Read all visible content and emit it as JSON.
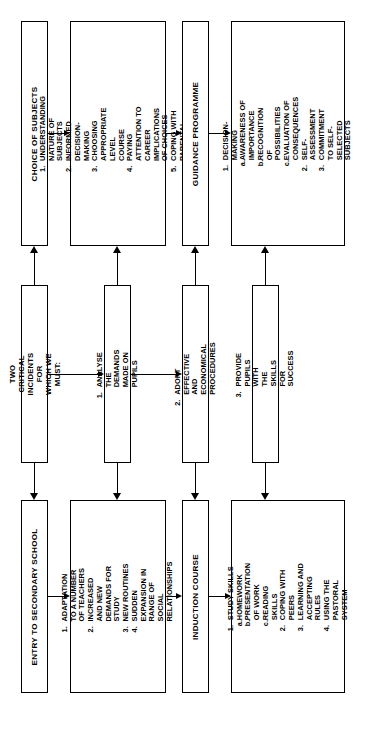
{
  "diagram": {
    "orientation": "text rotated 90 degrees counter-clockwise",
    "columns": [
      {
        "id": "col1",
        "top": {
          "label": "CHOICE OF SUBJECTS"
        },
        "middle": {
          "label": "TWO CRITICAL INCIDENTS\nFOR WHICH WE MUST:"
        },
        "bottom": {
          "label": "ENTRY TO SECONDARY SCHOOL"
        }
      },
      {
        "id": "col2",
        "top": {
          "items": [
            {
              "marker": "1.",
              "text": "UNDERSTANDING NATURE OF\nSUBJECTS"
            },
            {
              "marker": "2.",
              "text": "INFORMED DECISION-MAKING"
            },
            {
              "marker": "3.",
              "text": "CHOOSING APPROPRIATE LEVEL\nCOURSE"
            },
            {
              "marker": "4.",
              "text": "PAYING ATTENTION TO CAREER\nIMPLICATIONS OF CHOICES"
            },
            {
              "marker": "5.",
              "text": "COPING WITH PARENTAL INFLUENCE"
            }
          ]
        },
        "middle": {
          "marker": "1.",
          "label": "ANALYSE THE DEMANDS\nMADE ON PUPILS"
        },
        "bottom": {
          "items": [
            {
              "marker": "1.",
              "text": "ADAPTATION TO A NUMBER\nOF TEACHERS"
            },
            {
              "marker": "2.",
              "text": "INCREASED AND NEW\nDEMANDS FOR STUDY"
            },
            {
              "marker": "3.",
              "text": "NEW ROUTINES"
            },
            {
              "marker": "4.",
              "text": "SUDDEN EXPANSION IN\nRANGE OF SOCIAL\nRELATIONSHIPS"
            }
          ]
        }
      },
      {
        "id": "col3",
        "top": {
          "label": "GUIDANCE PROGRAMME"
        },
        "middle": {
          "marker": "2.",
          "label": "ADOPT EFFECTIVE AND\nECONOMICAL PROCEDURES"
        },
        "bottom": {
          "label": "INDUCTION COURSE"
        }
      },
      {
        "id": "col4",
        "top": {
          "items": [
            {
              "marker": "1.",
              "text": "DECISION-MAKING"
            },
            {
              "marker": "a.",
              "sub": true,
              "text": "AWARENESS OF IMPORTANCE"
            },
            {
              "marker": "b.",
              "sub": true,
              "text": "RECOGNITION OF POSSIBILITIES"
            },
            {
              "marker": "c.",
              "sub": true,
              "text": "EVALUATION OF CONSEQUENCES"
            },
            {
              "marker": "2.",
              "text": "SELF-ASSESSMENT"
            },
            {
              "marker": "3.",
              "text": "COMMITMENT TO SELF-SELECTED\nSUBJECTS"
            }
          ]
        },
        "middle": {
          "marker": "3.",
          "label": "PROVIDE PUPILS WITH\nTHE SKILLS FOR SUCCESS"
        },
        "bottom": {
          "items": [
            {
              "marker": "1.",
              "text": "STUDY SKILLS"
            },
            {
              "marker": "a.",
              "sub": true,
              "text": "HOMEWORK"
            },
            {
              "marker": "b.",
              "sub": true,
              "text": "PRESENTATION OF WORK"
            },
            {
              "marker": "c.",
              "sub": true,
              "text": "READING SKILLS"
            },
            {
              "marker": "2.",
              "text": "COPING WITH PEERS"
            },
            {
              "marker": "3.",
              "text": "LEARNING AND ACCEPTING\nRULES"
            },
            {
              "marker": "4.",
              "text": "USING THE PASTORAL\nSYSTEM"
            }
          ]
        }
      }
    ],
    "colors": {
      "stroke": "#000000",
      "background": "#ffffff"
    }
  }
}
